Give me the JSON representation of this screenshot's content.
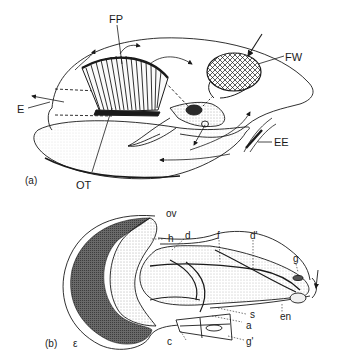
{
  "panel_a": {
    "tag": "(a)",
    "labels": {
      "FP": "FP",
      "FW": "FW",
      "E": "E",
      "EE": "EE",
      "OT": "OT"
    }
  },
  "panel_b": {
    "tag": "(b)",
    "labels": {
      "ov": "ov",
      "h": "h",
      "d": "d",
      "f": "f",
      "d_prime": "d'",
      "g": "g",
      "s": "s",
      "en": "en",
      "a": "a",
      "c": "c",
      "g_prime": "g'",
      "epsilon": "ε"
    }
  },
  "colors": {
    "ink": "#1a1a1a",
    "stipple_dark": "#3a3a3a",
    "stipple_light": "#bdbdbd",
    "background": "#ffffff"
  }
}
